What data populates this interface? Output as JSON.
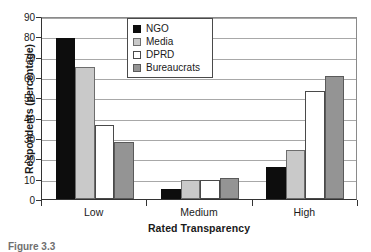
{
  "chart_data": {
    "type": "bar",
    "title": "",
    "xlabel": "Rated Transparency",
    "ylabel": "Respondents (percentage)",
    "categories": [
      "Low",
      "Medium",
      "High"
    ],
    "ylim": [
      0,
      90
    ],
    "yticks": [
      0,
      10,
      20,
      30,
      40,
      50,
      60,
      70,
      80,
      90
    ],
    "ytick_labels": [
      "0",
      "10",
      "20",
      "30",
      "40",
      "50",
      "60",
      "70",
      "80",
      "90"
    ],
    "grid": "horizontal",
    "legend_position": "upper-center",
    "series": [
      {
        "name": "NGO",
        "color": "#0d0d0d",
        "values": [
          79,
          5,
          15.5
        ]
      },
      {
        "name": "Media",
        "color": "#c9c9c9",
        "values": [
          65,
          9.5,
          24
        ]
      },
      {
        "name": "DPRD",
        "color": "#ffffff",
        "values": [
          36.5,
          9.5,
          53
        ]
      },
      {
        "name": "Bureaucrats",
        "color": "#949494",
        "values": [
          28,
          10.5,
          60.5
        ]
      }
    ]
  },
  "caption": {
    "text": "Figure 3.3"
  }
}
